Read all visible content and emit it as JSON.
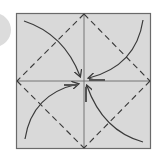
{
  "diagram": {
    "type": "origami-fold-diagram",
    "colors": {
      "background": "#ffffff",
      "paper": "#d9d9d9",
      "border": "#6a6a6a",
      "line": "#3a3a3a",
      "side_circle": "#dcdcdc"
    },
    "elements": {
      "square": {
        "x": 16,
        "y": 13,
        "w": 135,
        "h": 136
      },
      "center": {
        "x": 84,
        "y": 81
      },
      "crease_lines": [
        "vertical-center",
        "horizontal-center"
      ],
      "fold_lines": [
        "top-to-left",
        "top-to-right",
        "bottom-to-left",
        "bottom-to-right"
      ],
      "arrows": [
        {
          "from": "top-left-corner",
          "to": "center"
        },
        {
          "from": "top-right-corner",
          "to": "center"
        },
        {
          "from": "bottom-left-corner",
          "to": "center"
        },
        {
          "from": "bottom-right-corner",
          "to": "center"
        }
      ]
    }
  }
}
